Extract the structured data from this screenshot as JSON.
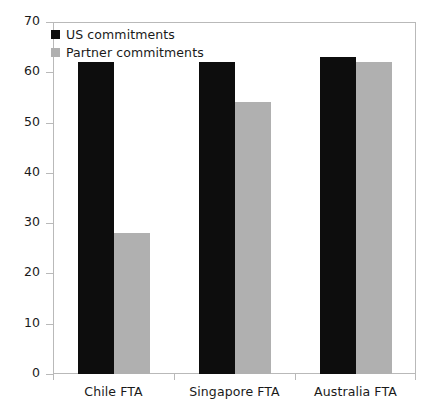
{
  "chart_data": {
    "type": "bar",
    "title": "",
    "xlabel": "",
    "ylabel": "",
    "ylim": [
      0,
      70
    ],
    "yticks": [
      "0",
      "10",
      "20",
      "30",
      "40",
      "50",
      "60",
      "70"
    ],
    "grid": false,
    "legend_position": "top-left inside plot area",
    "categories": [
      "Chile FTA",
      "Singapore FTA",
      "Australia FTA"
    ],
    "series": [
      {
        "name": "US commitments",
        "color": "#0d0d0d",
        "values": [
          62,
          62,
          63
        ]
      },
      {
        "name": "Partner commitments",
        "color": "#b0b0b0",
        "values": [
          28,
          54,
          62
        ]
      }
    ]
  },
  "legend": {
    "items": [
      {
        "label": "US commitments",
        "swatch": "us"
      },
      {
        "label": "Partner commitments",
        "swatch": "partner"
      }
    ]
  },
  "colors": {
    "us": "#0d0d0d",
    "partner": "#b0b0b0",
    "frame": "#b9b9b9",
    "text": "#1a1a1a",
    "background": "#ffffff"
  }
}
